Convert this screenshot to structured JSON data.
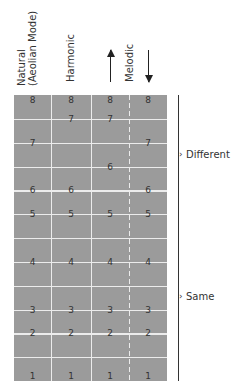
{
  "columns": [
    {
      "id": "natural",
      "label_line1": "Natural",
      "label_line2": "(Aeolian Mode)"
    },
    {
      "id": "harmonic",
      "label_line1": "Harmonic"
    },
    {
      "id": "melodic_up",
      "direction": "ascending"
    },
    {
      "id": "melodic_down",
      "direction": "descending"
    }
  ],
  "melodic_label": "Melodic",
  "grid": {
    "rows": 12,
    "semitone_rows": 12
  },
  "degrees": {
    "natural": [
      {
        "d": "8",
        "st": 12
      },
      {
        "d": "7",
        "st": 10
      },
      {
        "d": "6",
        "st": 8
      },
      {
        "d": "5",
        "st": 7
      },
      {
        "d": "4",
        "st": 5
      },
      {
        "d": "3",
        "st": 3
      },
      {
        "d": "2",
        "st": 2
      },
      {
        "d": "1",
        "st": 0
      }
    ],
    "harmonic": [
      {
        "d": "8",
        "st": 12
      },
      {
        "d": "7",
        "st": 11
      },
      {
        "d": "6",
        "st": 8
      },
      {
        "d": "5",
        "st": 7
      },
      {
        "d": "4",
        "st": 5
      },
      {
        "d": "3",
        "st": 3
      },
      {
        "d": "2",
        "st": 2
      },
      {
        "d": "1",
        "st": 0
      }
    ],
    "melodic_up": [
      {
        "d": "8",
        "st": 12
      },
      {
        "d": "7",
        "st": 11
      },
      {
        "d": "6",
        "st": 9
      },
      {
        "d": "5",
        "st": 7
      },
      {
        "d": "4",
        "st": 5
      },
      {
        "d": "3",
        "st": 3
      },
      {
        "d": "2",
        "st": 2
      },
      {
        "d": "1",
        "st": 0
      }
    ],
    "melodic_down": [
      {
        "d": "8",
        "st": 12
      },
      {
        "d": "7",
        "st": 10
      },
      {
        "d": "6",
        "st": 8
      },
      {
        "d": "5",
        "st": 7
      },
      {
        "d": "4",
        "st": 5
      },
      {
        "d": "3",
        "st": 3
      },
      {
        "d": "2",
        "st": 2
      },
      {
        "d": "1",
        "st": 0
      }
    ]
  },
  "brackets": {
    "different": "Different",
    "same": "Same"
  },
  "colors": {
    "grid_fill": "#9b9b9b",
    "grid_line": "#ececec",
    "text": "#333333"
  }
}
